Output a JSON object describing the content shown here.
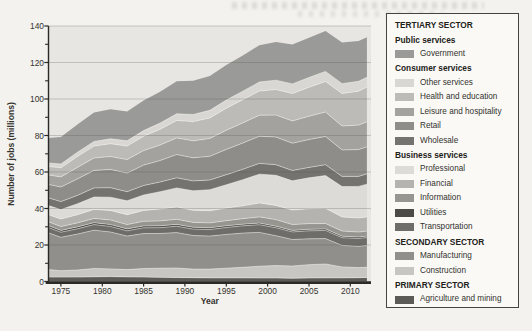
{
  "chart_data": {
    "type": "area",
    "stacked": true,
    "title": "",
    "xlabel": "Year",
    "ylabel": "Number of jobs (millions)",
    "xlim": [
      1973.5,
      2012.5
    ],
    "ylim": [
      0,
      140
    ],
    "grid": "horizontal",
    "legend_position": "right",
    "xticks": [
      1975,
      1980,
      1985,
      1990,
      1995,
      2000,
      2005,
      2010
    ],
    "ytick_labels": [
      0,
      20,
      40,
      60,
      80,
      100,
      120,
      140
    ],
    "ytick_minor_step": 10,
    "x": [
      1973,
      1975,
      1977,
      1979,
      1981,
      1983,
      1985,
      1987,
      1989,
      1991,
      1993,
      1995,
      1997,
      1999,
      2001,
      2003,
      2005,
      2007,
      2009,
      2011,
      2012
    ],
    "series_order": "bottom-to-top",
    "series": [
      {
        "name": "Agriculture and mining",
        "sector": "PRIMARY SECTOR",
        "color": "#5c5b57",
        "values": [
          2.4,
          2.4,
          2.4,
          2.6,
          2.7,
          2.5,
          2.4,
          2.3,
          2.2,
          2.1,
          2.0,
          2.0,
          2.0,
          1.9,
          1.9,
          1.8,
          1.9,
          2.0,
          2.0,
          2.1,
          2.2
        ]
      },
      {
        "name": "Construction",
        "sector": "SECONDARY SECTOR",
        "color": "#c7c6c2",
        "values": [
          4.1,
          3.5,
          3.9,
          4.5,
          4.2,
          4.0,
          4.7,
          5.0,
          5.2,
          4.7,
          4.8,
          5.3,
          5.8,
          6.5,
          6.8,
          6.7,
          7.3,
          7.6,
          6.0,
          5.5,
          5.6
        ]
      },
      {
        "name": "Manufacturing",
        "sector": "SECONDARY SECTOR",
        "color": "#908f8b",
        "values": [
          20.2,
          18.3,
          19.7,
          21.0,
          20.2,
          18.4,
          19.2,
          19.0,
          19.4,
          18.4,
          18.1,
          18.5,
          18.7,
          18.5,
          16.4,
          14.5,
          14.2,
          13.9,
          11.8,
          11.7,
          11.9
        ]
      },
      {
        "name": "Transportation",
        "sector": "TERTIARY SECTOR",
        "group": "Business services",
        "color": "#6e6d69",
        "values": [
          2.9,
          2.8,
          2.9,
          3.1,
          3.1,
          2.9,
          3.1,
          3.2,
          3.5,
          3.5,
          3.6,
          3.8,
          4.0,
          4.2,
          4.4,
          4.2,
          4.4,
          4.5,
          4.2,
          4.3,
          4.4
        ]
      },
      {
        "name": "Utilities",
        "sector": "TERTIARY SECTOR",
        "group": "Business services",
        "color": "#4b4a46",
        "values": [
          1.0,
          1.0,
          1.0,
          1.0,
          1.0,
          1.0,
          1.0,
          1.0,
          1.0,
          1.0,
          0.9,
          0.9,
          0.9,
          0.9,
          0.8,
          0.8,
          0.8,
          0.8,
          0.8,
          0.8,
          0.8
        ]
      },
      {
        "name": "Information",
        "sector": "TERTIARY SECTOR",
        "group": "Business services",
        "color": "#96958f",
        "values": [
          2.1,
          2.1,
          2.2,
          2.4,
          2.5,
          2.4,
          2.6,
          2.7,
          2.8,
          2.7,
          2.7,
          2.8,
          3.0,
          3.4,
          3.6,
          3.2,
          3.1,
          3.0,
          2.8,
          2.7,
          2.7
        ]
      },
      {
        "name": "Financial",
        "sector": "TERTIARY SECTOR",
        "group": "Business services",
        "color": "#b4b3af",
        "values": [
          3.9,
          4.1,
          4.5,
          4.9,
          5.2,
          5.4,
          5.9,
          6.5,
          6.7,
          6.6,
          6.7,
          6.9,
          7.1,
          7.6,
          7.8,
          8.0,
          8.2,
          8.3,
          7.8,
          7.7,
          7.8
        ]
      },
      {
        "name": "Professional",
        "sector": "TERTIARY SECTOR",
        "group": "Business services",
        "color": "#dcdbd7",
        "values": [
          5.0,
          5.2,
          6.0,
          6.8,
          7.3,
          7.6,
          8.5,
          9.5,
          10.5,
          10.7,
          11.5,
          12.8,
          14.3,
          15.8,
          16.5,
          16.0,
          16.9,
          17.9,
          16.6,
          17.3,
          17.9
        ]
      },
      {
        "name": "Wholesale",
        "sector": "TERTIARY SECTOR",
        "group": "Consumer services",
        "color": "#74736f",
        "values": [
          4.2,
          4.4,
          4.6,
          5.0,
          5.2,
          5.0,
          5.2,
          5.3,
          5.5,
          5.4,
          5.3,
          5.5,
          5.7,
          5.9,
          5.8,
          5.6,
          5.7,
          6.0,
          5.6,
          5.5,
          5.7
        ]
      },
      {
        "name": "Retail",
        "sector": "TERTIARY SECTOR",
        "group": "Consumer services",
        "color": "#8e8d89",
        "values": [
          7.4,
          8.0,
          9.0,
          9.6,
          10.0,
          10.2,
          11.2,
          11.8,
          12.8,
          12.7,
          13.0,
          13.9,
          14.4,
          14.9,
          15.2,
          15.0,
          15.3,
          15.5,
          14.5,
          14.7,
          14.8
        ]
      },
      {
        "name": "Leisure and hospitality",
        "sector": "TERTIARY SECTOR",
        "group": "Consumer services",
        "color": "#a3a29e",
        "values": [
          5.2,
          5.5,
          6.3,
          6.8,
          7.1,
          7.4,
          7.9,
          8.5,
          9.1,
          9.3,
          9.8,
          10.5,
          11.0,
          11.5,
          12.0,
          12.2,
          12.8,
          13.4,
          13.1,
          13.4,
          13.7
        ]
      },
      {
        "name": "Health and education",
        "sector": "TERTIARY SECTOR",
        "group": "Consumer services",
        "color": "#bcbbb7",
        "values": [
          4.6,
          5.0,
          6.0,
          6.5,
          7.0,
          7.4,
          7.9,
          8.6,
          9.5,
          10.5,
          11.2,
          12.0,
          12.7,
          13.3,
          14.0,
          15.0,
          15.8,
          16.7,
          17.8,
          18.6,
          19.0
        ]
      },
      {
        "name": "Other services",
        "sector": "TERTIARY SECTOR",
        "group": "Consumer services",
        "color": "#d8d7d3",
        "values": [
          2.0,
          2.1,
          2.3,
          2.5,
          2.7,
          2.9,
          3.1,
          3.4,
          3.7,
          3.9,
          4.2,
          4.5,
          4.7,
          4.9,
          5.1,
          5.3,
          5.4,
          5.5,
          5.4,
          5.4,
          5.4
        ]
      },
      {
        "name": "Government",
        "sector": "TERTIARY SECTOR",
        "group": "Public services",
        "color": "#9a9a98",
        "values": [
          13.7,
          14.7,
          15.2,
          15.9,
          16.2,
          16.0,
          16.5,
          17.2,
          17.8,
          18.5,
          18.8,
          19.3,
          19.6,
          20.2,
          20.9,
          21.5,
          21.8,
          22.2,
          22.5,
          22.1,
          21.9
        ]
      }
    ]
  },
  "legend": {
    "rows": [
      {
        "style": "section",
        "label": "TERTIARY SECTOR"
      },
      {
        "style": "group",
        "label": "Public services"
      },
      {
        "style": "item",
        "label": "Government",
        "color": "#9a9a98"
      },
      {
        "style": "group",
        "label": "Consumer services"
      },
      {
        "style": "item",
        "label": "Other services",
        "color": "#d8d7d3"
      },
      {
        "style": "item",
        "label": "Health and education",
        "color": "#bcbbb7"
      },
      {
        "style": "item",
        "label": "Leisure and hospitality",
        "color": "#a3a29e"
      },
      {
        "style": "item",
        "label": "Retail",
        "color": "#8e8d89"
      },
      {
        "style": "item",
        "label": "Wholesale",
        "color": "#74736f"
      },
      {
        "style": "group",
        "label": "Business services"
      },
      {
        "style": "item",
        "label": "Professional",
        "color": "#dcdbd7"
      },
      {
        "style": "item",
        "label": "Financial",
        "color": "#b4b3af"
      },
      {
        "style": "item",
        "label": "Information",
        "color": "#96958f"
      },
      {
        "style": "item",
        "label": "Utilities",
        "color": "#4b4a46"
      },
      {
        "style": "item",
        "label": "Transportation",
        "color": "#6e6d69"
      },
      {
        "style": "section",
        "label": "SECONDARY SECTOR"
      },
      {
        "style": "item",
        "label": "Manufacturing",
        "color": "#908f8b"
      },
      {
        "style": "item",
        "label": "Construction",
        "color": "#c7c6c2"
      },
      {
        "style": "section",
        "label": "PRIMARY SECTOR"
      },
      {
        "style": "item",
        "label": "Agriculture and mining",
        "color": "#5c5b57"
      }
    ]
  },
  "colors": {
    "page_bg": "#f3f2ee",
    "plot_bg": "#e7e6e2",
    "axis": "#2b2a26",
    "tick_text": "#35342f",
    "gridline": "#55544f",
    "band_hairline": "#fbfaf7",
    "legend_bg": "#faf9f6",
    "legend_border": "#45443f"
  }
}
